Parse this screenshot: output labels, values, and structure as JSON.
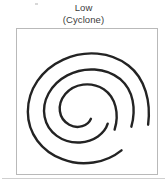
{
  "figure": {
    "width": 167,
    "height": 187,
    "background_color": "#ffffff"
  },
  "caption": {
    "line1": "Low",
    "line2": "(Cyclone)",
    "text_color": "#3b3b3b",
    "align": "center"
  },
  "symbol_box": {
    "border_color": "#b9b9b9",
    "fill_color": "#ffffff",
    "name": "low-pressure-cyclone-symbol"
  },
  "spiral": {
    "stroke_color": "#232323",
    "rotation_sense": "counterclockwise",
    "arm_count": 2,
    "label": "cyclone-spiral"
  },
  "bottom_rule": {
    "color": "#cfcfcf"
  },
  "speck": {
    "color": "#d8d8d8"
  }
}
